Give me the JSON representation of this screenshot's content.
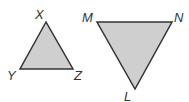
{
  "colors": {
    "fill": "#cfcfcf",
    "stroke": "#333333",
    "label": "#333333"
  },
  "triangles": [
    {
      "name": "XYZ",
      "vertices": {
        "X": {
          "x": 46,
          "y": 22,
          "label": "X"
        },
        "Y": {
          "x": 20,
          "y": 69,
          "label": "Y"
        },
        "Z": {
          "x": 73,
          "y": 69,
          "label": "Z"
        }
      }
    },
    {
      "name": "MNL",
      "vertices": {
        "M": {
          "x": 97,
          "y": 22,
          "label": "M"
        },
        "N": {
          "x": 172,
          "y": 22,
          "label": "N"
        },
        "L": {
          "x": 135,
          "y": 89,
          "label": "L"
        }
      }
    }
  ]
}
